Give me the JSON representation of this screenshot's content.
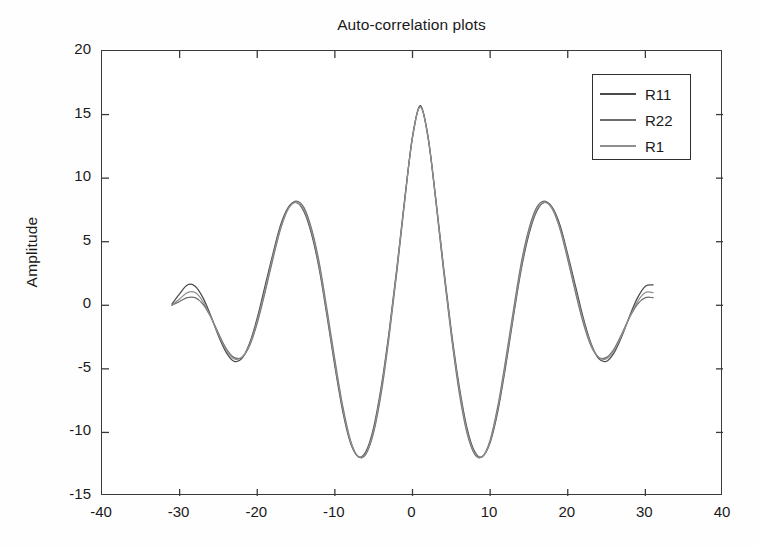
{
  "chart_data": {
    "type": "line",
    "title": "Auto-correlation plots",
    "xlabel": "",
    "ylabel": "Amplitude",
    "xlim": [
      -40,
      40
    ],
    "ylim": [
      -15,
      20
    ],
    "xticks": [
      -40,
      -30,
      -20,
      -10,
      0,
      10,
      20,
      30,
      40
    ],
    "yticks": [
      -15,
      -10,
      -5,
      0,
      5,
      10,
      15,
      20
    ],
    "xtick_labels": [
      "-40",
      "-30",
      "-20",
      "-10",
      "0",
      "10",
      "20",
      "30",
      "40"
    ],
    "ytick_labels": [
      "-15",
      "-10",
      "-5",
      "0",
      "5",
      "10",
      "15",
      "20"
    ],
    "grid": false,
    "box": true,
    "tick_direction": "in",
    "legend_position": "upper right",
    "legend_entries": [
      "R11",
      "R22",
      "R1"
    ],
    "series": [
      {
        "name": "R11",
        "color": "#4a4a4a",
        "x": [
          -31,
          -30,
          -29,
          -28,
          -27,
          -26,
          -25,
          -24,
          -23,
          -22,
          -21,
          -20,
          -19,
          -18,
          -17,
          -16,
          -15,
          -14,
          -13,
          -12,
          -11,
          -10,
          -9,
          -8,
          -7,
          -6,
          -5,
          -4,
          -3,
          -2,
          -1,
          0,
          1,
          2,
          3,
          4,
          5,
          6,
          7,
          8,
          9,
          10,
          11,
          12,
          13,
          14,
          15,
          16,
          17,
          18,
          19,
          20,
          21,
          22,
          23,
          24,
          25,
          26,
          27,
          28,
          29,
          30,
          31
        ],
        "y": [
          0.1,
          0.9,
          1.6,
          1.5,
          0.6,
          -0.8,
          -2.4,
          -3.7,
          -4.4,
          -4.2,
          -3.0,
          -1.0,
          1.5,
          4.0,
          6.3,
          7.7,
          8.1,
          7.4,
          5.6,
          2.8,
          -0.9,
          -4.8,
          -8.3,
          -10.8,
          -11.9,
          -11.5,
          -9.6,
          -6.3,
          -2.0,
          3.0,
          8.4,
          13.2,
          15.7,
          13.2,
          8.4,
          3.0,
          -2.0,
          -6.3,
          -9.6,
          -11.5,
          -11.9,
          -10.8,
          -8.3,
          -4.8,
          -0.9,
          2.8,
          5.6,
          7.4,
          8.1,
          7.7,
          6.3,
          4.0,
          1.5,
          -1.0,
          -3.0,
          -4.2,
          -4.4,
          -3.7,
          -2.4,
          -0.8,
          0.6,
          1.5,
          1.6
        ]
      },
      {
        "name": "R22",
        "color": "#6d6d6d",
        "x": [
          -31,
          -30,
          -29,
          -28,
          -27,
          -26,
          -25,
          -24,
          -23,
          -22,
          -21,
          -20,
          -19,
          -18,
          -17,
          -16,
          -15,
          -14,
          -13,
          -12,
          -11,
          -10,
          -9,
          -8,
          -7,
          -6,
          -5,
          -4,
          -3,
          -2,
          -1,
          0,
          1,
          2,
          3,
          4,
          5,
          6,
          7,
          8,
          9,
          10,
          11,
          12,
          13,
          14,
          15,
          16,
          17,
          18,
          19,
          20,
          21,
          22,
          23,
          24,
          25,
          26,
          27,
          28,
          29,
          30,
          31
        ],
        "y": [
          0.0,
          0.3,
          0.6,
          0.6,
          0.1,
          -0.9,
          -2.2,
          -3.4,
          -4.1,
          -4.1,
          -3.2,
          -1.4,
          1.0,
          3.6,
          6.0,
          7.6,
          8.2,
          7.7,
          6.0,
          3.3,
          -0.4,
          -4.3,
          -7.9,
          -10.6,
          -11.9,
          -11.7,
          -10.0,
          -6.8,
          -2.4,
          2.7,
          8.2,
          13.3,
          15.6,
          13.3,
          8.2,
          2.7,
          -2.4,
          -6.8,
          -10.0,
          -11.7,
          -11.9,
          -10.6,
          -7.9,
          -4.3,
          -0.4,
          3.3,
          6.0,
          7.7,
          8.2,
          7.6,
          6.0,
          3.6,
          1.0,
          -1.4,
          -3.2,
          -4.1,
          -4.1,
          -3.4,
          -2.2,
          -0.9,
          0.1,
          0.6,
          0.6
        ]
      },
      {
        "name": "R1",
        "color": "#8e8e8e",
        "x": [
          -31,
          -30,
          -29,
          -28,
          -27,
          -26,
          -25,
          -24,
          -23,
          -22,
          -21,
          -20,
          -19,
          -18,
          -17,
          -16,
          -15,
          -14,
          -13,
          -12,
          -11,
          -10,
          -9,
          -8,
          -7,
          -6,
          -5,
          -4,
          -3,
          -2,
          -1,
          0,
          1,
          2,
          3,
          4,
          5,
          6,
          7,
          8,
          9,
          10,
          11,
          12,
          13,
          14,
          15,
          16,
          17,
          18,
          19,
          20,
          21,
          22,
          23,
          24,
          25,
          26,
          27,
          28,
          29,
          30,
          31
        ],
        "y": [
          0.0,
          0.5,
          1.0,
          1.0,
          0.3,
          -0.9,
          -2.3,
          -3.5,
          -4.2,
          -4.1,
          -3.1,
          -1.2,
          1.2,
          3.8,
          6.1,
          7.6,
          8.1,
          7.5,
          5.8,
          3.0,
          -0.7,
          -4.6,
          -8.1,
          -10.7,
          -11.9,
          -11.6,
          -9.8,
          -6.5,
          -2.2,
          2.9,
          8.3,
          13.2,
          15.6,
          13.2,
          8.3,
          2.9,
          -2.2,
          -6.5,
          -9.8,
          -11.6,
          -11.9,
          -10.7,
          -8.1,
          -4.6,
          -0.7,
          3.0,
          5.8,
          7.5,
          8.1,
          7.6,
          6.1,
          3.8,
          1.2,
          -1.2,
          -3.1,
          -4.1,
          -4.2,
          -3.5,
          -2.3,
          -0.9,
          0.3,
          1.0,
          1.0
        ]
      }
    ],
    "annotations": [],
    "notes": {
      "peak_center_value": 15.7,
      "side_peak_value": 8.1,
      "trough_value": -11.9,
      "outer_trough_value": -4.4
    }
  },
  "legend": {
    "rows": [
      {
        "label": "R11",
        "color": "#4a4a4a"
      },
      {
        "label": "R22",
        "color": "#6d6d6d"
      },
      {
        "label": "R1",
        "color": "#8e8e8e"
      }
    ]
  },
  "axes": {
    "frame_color": "#3a3a3a",
    "background": "#ffffff"
  }
}
